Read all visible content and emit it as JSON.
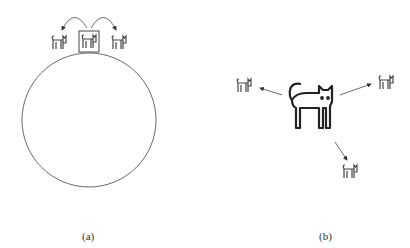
{
  "panels": [
    {
      "id": "a",
      "caption": "(a)",
      "description": "circle with three cat icons on top, middle boxed, arrows to neighbors"
    },
    {
      "id": "b",
      "caption": "(b)",
      "description": "large central cat with arrows pointing to three small cats"
    }
  ],
  "colors": {
    "stroke": "#333333",
    "arrow": "#444444"
  }
}
